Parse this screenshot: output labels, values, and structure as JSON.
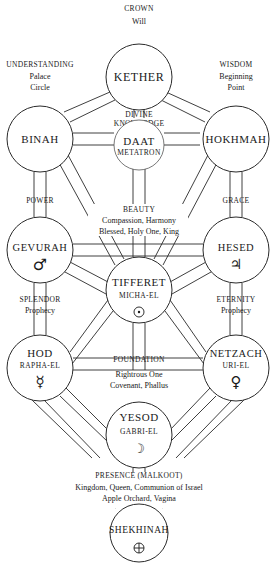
{
  "diagram": {
    "colors": {
      "line": "#2a2a2a",
      "text": "#1a1a1a",
      "background": "#ffffff"
    },
    "nodes": {
      "kether": {
        "name": "KETHER",
        "labels": [
          "CROWN",
          "Will"
        ]
      },
      "binah": {
        "name": "BINAH",
        "labels": [
          "UNDERSTANDING",
          "Palace",
          "Circle"
        ]
      },
      "hokhmah": {
        "name": "HOKHMAH",
        "labels": [
          "WISDOM",
          "Beginning",
          "Point"
        ]
      },
      "daat": {
        "name": "DAAT",
        "angel": "METATRON",
        "labels": [
          "DIVINE",
          "KNOWLEDGE"
        ]
      },
      "gevurah": {
        "name": "GEVURAH",
        "symbol": "♂",
        "symbol_name": "mars-icon",
        "labels": [
          "POWER"
        ]
      },
      "hesed": {
        "name": "HESED",
        "symbol": "♃",
        "symbol_name": "jupiter-icon",
        "labels": [
          "GRACE"
        ]
      },
      "tifferet": {
        "name": "TIFFERET",
        "angel": "MICHA-EL",
        "symbol": "☉",
        "symbol_name": "sun-icon",
        "labels": [
          "BEAUTY",
          "Compassion, Harmony",
          "Blessed, Holy One, King"
        ]
      },
      "hod": {
        "name": "HOD",
        "angel": "RAPHA-EL",
        "symbol": "☿",
        "symbol_name": "mercury-icon",
        "labels": [
          "SPLENDOR",
          "Prophecy"
        ]
      },
      "netzach": {
        "name": "NETZACH",
        "angel": "URI-EL",
        "symbol": "♀",
        "symbol_name": "venus-icon",
        "labels": [
          "ETERNITY",
          "Prophecy"
        ]
      },
      "yesod": {
        "name": "YESOD",
        "angel": "GABRI-EL",
        "symbol": "☽",
        "symbol_name": "moon-icon",
        "labels": [
          "FOUNDATION",
          "Rightrous One",
          "Covenant, Phallus"
        ]
      },
      "shekhinah": {
        "name": "SHEKHINAH",
        "symbol": "⊕",
        "symbol_name": "earth-icon",
        "labels": [
          "PRESENCE (MALKOOT)",
          "Kingdom, Queen, Communion of Israel",
          "Apple Orchard, Vagina"
        ]
      }
    }
  }
}
